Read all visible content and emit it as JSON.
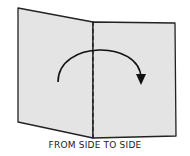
{
  "diagram": {
    "caption": "FROM SIDE TO SIDE",
    "colors": {
      "paper_fill": "#e4e4e4",
      "outline": "#222222",
      "arrow": "#111111"
    },
    "elements": [
      "folded-paper-sheet",
      "dashed-fold-line",
      "curved-arrow"
    ]
  }
}
